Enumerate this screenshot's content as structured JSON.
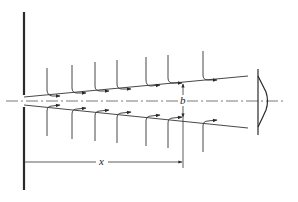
{
  "diagram": {
    "labels": {
      "distance": "x",
      "half_width": "b"
    },
    "colors": {
      "line": "#2a2a2a",
      "background": "#ffffff"
    },
    "upper_profiles_x": [
      47,
      72,
      95,
      117,
      146,
      172,
      203
    ],
    "lower_profiles_x": [
      47,
      72,
      95,
      117,
      146,
      172,
      203
    ]
  }
}
